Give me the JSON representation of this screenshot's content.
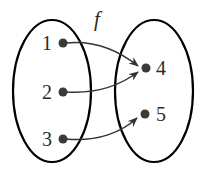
{
  "diagram": {
    "function_label": "f",
    "domain": {
      "elements": [
        {
          "label": "1",
          "x": 63,
          "y": 43
        },
        {
          "label": "2",
          "x": 63,
          "y": 92
        },
        {
          "label": "3",
          "x": 63,
          "y": 139
        }
      ]
    },
    "codomain": {
      "elements": [
        {
          "label": "4",
          "x": 146,
          "y": 68
        },
        {
          "label": "5",
          "x": 145,
          "y": 114
        }
      ]
    },
    "mappings": [
      {
        "from": "1",
        "to": "4"
      },
      {
        "from": "2",
        "to": "4"
      },
      {
        "from": "3",
        "to": "5"
      }
    ],
    "colors": {
      "stroke": "#000000",
      "dot": "#3a3a3a",
      "text": "#2a2a2a"
    }
  }
}
